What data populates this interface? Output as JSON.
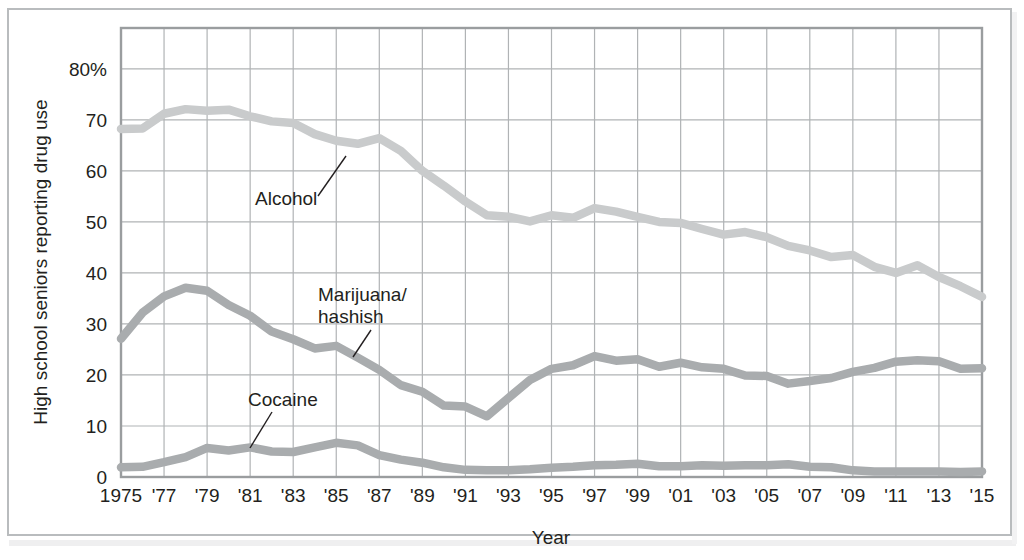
{
  "figure": {
    "frame_color": "#b9bcbe",
    "background": "#ffffff"
  },
  "axis": {
    "y_title": "High school seniors reporting drug use",
    "x_title": "Year",
    "y_ticks": [
      "0",
      "10",
      "20",
      "30",
      "40",
      "50",
      "60",
      "70",
      "80%"
    ],
    "y_tick_values": [
      0,
      10,
      20,
      30,
      40,
      50,
      60,
      70,
      80
    ],
    "x_ticks": [
      "1975",
      "'77",
      "'79",
      "'81",
      "'83",
      "'85",
      "'87",
      "'89",
      "'91",
      "'93",
      "'95",
      "'97",
      "'99",
      "'01",
      "'03",
      "'05",
      "'07",
      "'09",
      "'11",
      "'13",
      "'15"
    ],
    "x_tick_values": [
      1975,
      1977,
      1979,
      1981,
      1983,
      1985,
      1987,
      1989,
      1991,
      1993,
      1995,
      1997,
      1999,
      2001,
      2003,
      2005,
      2007,
      2009,
      2011,
      2013,
      2015
    ]
  },
  "annotations": [
    {
      "name": "alcohol",
      "label": "Alcohol",
      "x": 255,
      "y": 205
    },
    {
      "name": "marijuana",
      "label": "Marijuana/",
      "x": 318,
      "y": 301
    },
    {
      "name": "marijuana2",
      "label": "hashish",
      "x": 318,
      "y": 323
    },
    {
      "name": "cocaine",
      "label": "Cocaine",
      "x": 248,
      "y": 406
    }
  ],
  "chart_data": {
    "type": "line",
    "title": "",
    "xlabel": "Year",
    "ylabel": "High school seniors reporting drug use",
    "xlim": [
      1975,
      2015
    ],
    "ylim": [
      0,
      88
    ],
    "grid": true,
    "legend": "inline-annotations",
    "x": [
      1975,
      1976,
      1977,
      1978,
      1979,
      1980,
      1981,
      1982,
      1983,
      1984,
      1985,
      1986,
      1987,
      1988,
      1989,
      1990,
      1991,
      1992,
      1993,
      1994,
      1995,
      1996,
      1997,
      1998,
      1999,
      2000,
      2001,
      2002,
      2003,
      2004,
      2005,
      2006,
      2007,
      2008,
      2009,
      2010,
      2011,
      2012,
      2013,
      2014,
      2015
    ],
    "series": [
      {
        "name": "Alcohol",
        "color": "#c9cbcc",
        "values": [
          68.2,
          68.3,
          71.2,
          72.1,
          71.8,
          72.0,
          70.7,
          69.7,
          69.4,
          67.2,
          65.9,
          65.3,
          66.4,
          63.9,
          60.0,
          57.1,
          54.0,
          51.3,
          51.0,
          50.1,
          51.3,
          50.8,
          52.7,
          52.0,
          51.0,
          50.0,
          49.8,
          48.6,
          47.5,
          48.0,
          47.0,
          45.3,
          44.4,
          43.1,
          43.5,
          41.2,
          40.0,
          41.5,
          39.2,
          37.4,
          35.3
        ]
      },
      {
        "name": "Marijuana/hashish",
        "color": "#a9acae",
        "values": [
          27.1,
          32.2,
          35.4,
          37.1,
          36.5,
          33.7,
          31.6,
          28.5,
          27.0,
          25.2,
          25.7,
          23.4,
          21.0,
          18.0,
          16.7,
          14.0,
          13.8,
          11.9,
          15.5,
          19.0,
          21.2,
          21.9,
          23.7,
          22.8,
          23.1,
          21.6,
          22.4,
          21.5,
          21.2,
          19.9,
          19.8,
          18.3,
          18.8,
          19.4,
          20.6,
          21.4,
          22.6,
          22.9,
          22.7,
          21.2,
          21.3
        ]
      },
      {
        "name": "Cocaine",
        "color": "#a9acae",
        "values": [
          1.9,
          2.0,
          2.9,
          3.9,
          5.7,
          5.2,
          5.8,
          5.0,
          4.9,
          5.8,
          6.7,
          6.2,
          4.3,
          3.4,
          2.8,
          1.9,
          1.4,
          1.3,
          1.3,
          1.5,
          1.8,
          2.0,
          2.3,
          2.4,
          2.6,
          2.1,
          2.1,
          2.3,
          2.2,
          2.3,
          2.3,
          2.5,
          2.0,
          1.9,
          1.3,
          1.1,
          1.1,
          1.1,
          1.1,
          1.0,
          1.1
        ]
      }
    ]
  }
}
